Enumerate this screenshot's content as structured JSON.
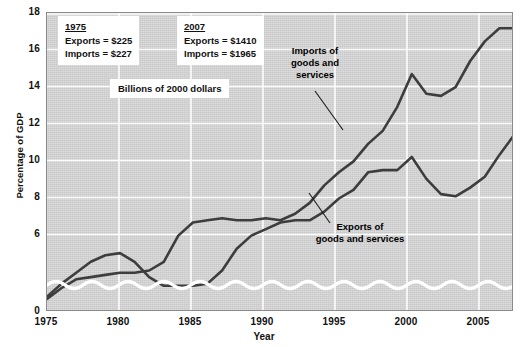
{
  "chart_data": {
    "type": "line",
    "title": "",
    "xlabel": "Year",
    "ylabel": "Percentage of GDP",
    "xlim": [
      1975,
      2007
    ],
    "ylim": [
      4.3,
      18
    ],
    "yticks": [
      0,
      6,
      8,
      10,
      12,
      14,
      16,
      18
    ],
    "xticks": [
      1975,
      1980,
      1985,
      1990,
      1995,
      2000,
      2005
    ],
    "grid": true,
    "axis_break": true,
    "legend_position": "inline-annotations",
    "x": [
      1975,
      1976,
      1977,
      1978,
      1979,
      1980,
      1981,
      1982,
      1983,
      1984,
      1985,
      1986,
      1987,
      1988,
      1989,
      1990,
      1991,
      1992,
      1993,
      1994,
      1995,
      1996,
      1997,
      1998,
      1999,
      2000,
      2001,
      2002,
      2003,
      2004,
      2005,
      2006,
      2007
    ],
    "series": [
      {
        "name": "Exports of goods and services",
        "values": [
          5.0,
          5.6,
          6.1,
          6.6,
          6.9,
          7.0,
          6.6,
          5.9,
          5.5,
          5.5,
          5.5,
          5.6,
          6.2,
          7.2,
          7.8,
          8.1,
          8.4,
          8.5,
          8.5,
          8.9,
          9.5,
          9.9,
          10.7,
          10.8,
          10.8,
          11.4,
          10.4,
          9.7,
          9.6,
          10.0,
          10.5,
          11.5,
          12.4
        ]
      },
      {
        "name": "Imports of goods and services",
        "values": [
          4.9,
          5.4,
          5.8,
          5.9,
          6.0,
          6.1,
          6.1,
          6.2,
          6.6,
          7.8,
          8.4,
          8.5,
          8.6,
          8.5,
          8.5,
          8.6,
          8.5,
          8.8,
          9.3,
          10.1,
          10.7,
          11.2,
          12.0,
          12.6,
          13.7,
          15.2,
          14.3,
          14.2,
          14.6,
          15.8,
          16.7,
          17.3,
          17.3
        ]
      }
    ],
    "callouts": [
      {
        "year_heading": "1975",
        "exports_line": "Exports  =  $225",
        "imports_line": "Imports  =  $227"
      },
      {
        "year_heading": "2007",
        "exports_line": "Exports  =  $1410",
        "imports_line": "Imports  =  $1965"
      }
    ],
    "units_note": "Billions of 2000 dollars",
    "annotations": [
      {
        "name": "imports-series-label",
        "text_line_1": "Imports of",
        "text_line_2": "goods and",
        "text_line_3": "services"
      },
      {
        "name": "exports-series-label",
        "text_line_1": "Exports of",
        "text_line_2": "goods and services"
      }
    ],
    "colors": {
      "plot_background": "#d3d3d3",
      "gridline": "#ffffff",
      "series_line": "#3a3a3a",
      "axis_break_wave": "#ffffff",
      "frame": "#8a8a8a",
      "text": "#111111"
    }
  },
  "axis": {
    "ytick_labels": [
      "18",
      "16",
      "14",
      "12",
      "10",
      "8",
      "6",
      "0"
    ],
    "xtick_labels": [
      "1975",
      "1980",
      "1985",
      "1990",
      "1995",
      "2000",
      "2005"
    ],
    "y_title": "Percentage of GDP",
    "x_title": "Year"
  }
}
